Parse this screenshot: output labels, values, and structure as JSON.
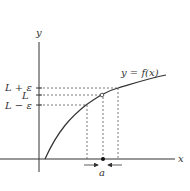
{
  "diagram": {
    "axes": {
      "x_label": "x",
      "y_label": "y"
    },
    "curve_label": "y = f(x)",
    "y_ticks": [
      {
        "label": "L + ε",
        "level": "upper"
      },
      {
        "label": "L",
        "level": "middle"
      },
      {
        "label": "L − ε",
        "level": "lower"
      }
    ],
    "x_point_label": "a",
    "colors": {
      "ink": "#333333",
      "dashed": "#555555"
    }
  }
}
